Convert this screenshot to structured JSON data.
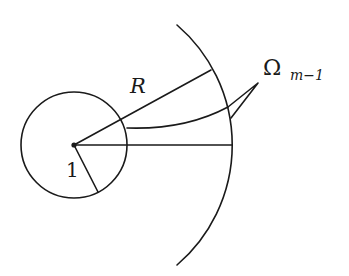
{
  "figure": {
    "colors": {
      "ink": "#1a1a1a",
      "background": "#ffffff"
    },
    "labels": {
      "radius_outer": "R",
      "radius_inner": "1",
      "region_main": "Ω",
      "region_subscript": "m−1"
    },
    "geometry": {
      "center": [
        74,
        145
      ],
      "inner_radius_px": 53,
      "outer_radius_px": 158
    }
  }
}
